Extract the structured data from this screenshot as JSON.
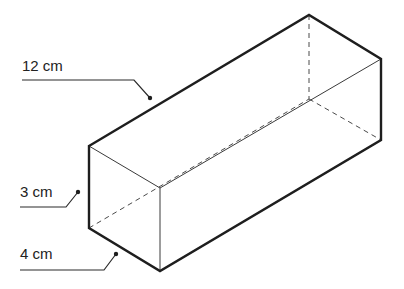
{
  "figure": {
    "type": "rectangular prism (cuboid) line drawing",
    "colors": {
      "background": "#ffffff",
      "outline": "#1e1e1e",
      "inner_edge": "#3a3a3a",
      "hidden_edge": "#4a4a4a",
      "label_text": "#222222"
    }
  },
  "labels": [
    {
      "id": "length",
      "text": "12 cm"
    },
    {
      "id": "height",
      "text": "3 cm"
    },
    {
      "id": "width",
      "text": "4 cm"
    }
  ]
}
